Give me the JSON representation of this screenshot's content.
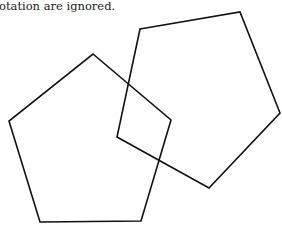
{
  "caption": {
    "text": "otation are ignored."
  },
  "figure": {
    "stroke_color": "#111111",
    "stroke_width": 1.6,
    "shapes": [
      {
        "name": "left-pentagon",
        "points": "93,54 171,120 141,221 40,222 9,121"
      },
      {
        "name": "right-pentagon",
        "points": "140,29 240,12 280,113 209,188 117,137"
      }
    ]
  }
}
